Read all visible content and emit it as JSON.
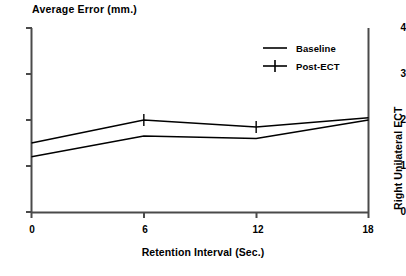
{
  "chart_data": {
    "type": "line",
    "title": "Average Error (mm.)",
    "xlabel": "Retention Interval (Sec.)",
    "ylabel": "Average Error (mm.)",
    "right_label": "Right Unilateral ECT",
    "x": [
      0,
      6,
      12,
      18
    ],
    "xticks": [
      "0",
      "6",
      "12",
      "18"
    ],
    "yticks": [
      "0",
      "1",
      "2",
      "3",
      "4"
    ],
    "xlim": [
      0,
      18
    ],
    "ylim": [
      0,
      4
    ],
    "grid": false,
    "legend_position": "top-right",
    "series": [
      {
        "name": "Post-ECT",
        "marker": "plus",
        "values": [
          1.5,
          2.0,
          1.85,
          2.05
        ]
      },
      {
        "name": "Baseline",
        "marker": "dash",
        "values": [
          1.2,
          1.65,
          1.6,
          2.0
        ]
      }
    ]
  },
  "legend": {
    "items": [
      {
        "label": "Baseline",
        "marker": "dash-marker"
      },
      {
        "label": "Post-ECT",
        "marker": "plus-marker"
      }
    ]
  },
  "axes": {
    "y_tick_4": "4",
    "y_tick_3": "3",
    "y_tick_2": "2",
    "y_tick_1": "1",
    "y_tick_0": "0",
    "x_tick_0": "0",
    "x_tick_6": "6",
    "x_tick_12": "12",
    "x_tick_18": "18"
  },
  "colors": {
    "line": "#000000",
    "axis": "#4a4a4a",
    "background": "#ffffff"
  }
}
